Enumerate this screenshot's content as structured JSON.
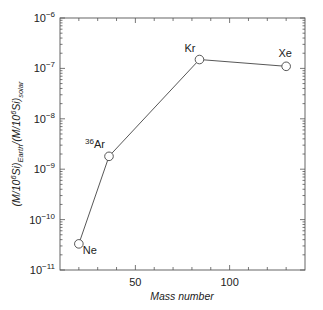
{
  "chart_data": {
    "type": "line",
    "title": "",
    "xlabel": "Mass number",
    "ylabel": "(M/10^6 Si)_Earth/(M/10^6 Si)_solar",
    "ylabel_parts": {
      "open": "(M/10",
      "exp1": "6",
      "mid1": "Si)",
      "sub1": "Earth",
      "mid2": "/(M/10",
      "exp2": "6",
      "mid3": "Si)",
      "sub2": "solar"
    },
    "xscale": "linear",
    "yscale": "log",
    "xlim": [
      10,
      140
    ],
    "ylim": [
      1e-11,
      1e-06
    ],
    "xticks_major": [
      50,
      100
    ],
    "xticks_minor": [
      20,
      30,
      40,
      60,
      70,
      80,
      90,
      110,
      120,
      130
    ],
    "yticks": [
      {
        "value": 1e-06,
        "base": "10",
        "exp": "−6"
      },
      {
        "value": 1e-07,
        "base": "10",
        "exp": "−7"
      },
      {
        "value": 1e-08,
        "base": "10",
        "exp": "−8"
      },
      {
        "value": 1e-09,
        "base": "10",
        "exp": "−9"
      },
      {
        "value": 1e-10,
        "base": "10",
        "exp": "−10"
      },
      {
        "value": 1e-11,
        "base": "10",
        "exp": "−11"
      }
    ],
    "grid": false,
    "legend": null,
    "series": [
      {
        "name": "Noble gases",
        "marker": "open-circle",
        "points": [
          {
            "label": "Ne",
            "label_sup": "",
            "x": 20,
            "y": 3.3e-11,
            "label_pos": "right-below"
          },
          {
            "label": "Ar",
            "label_sup": "36",
            "x": 36,
            "y": 1.8e-09,
            "label_pos": "left-above"
          },
          {
            "label": "Kr",
            "label_sup": "",
            "x": 84,
            "y": 1.5e-07,
            "label_pos": "left-above"
          },
          {
            "label": "Xe",
            "label_sup": "",
            "x": 130,
            "y": 1.1e-07,
            "label_pos": "above"
          }
        ]
      }
    ]
  }
}
